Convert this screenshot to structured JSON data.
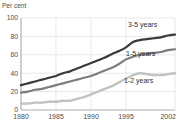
{
  "header": {
    "clipped_title": "",
    "unit_label": "Per cent"
  },
  "chart_data": {
    "type": "line",
    "title": "",
    "subtitle": "",
    "xlabel": "",
    "ylabel": "Per cent",
    "unit_label": "Per cent",
    "xlim": [
      1980,
      2002
    ],
    "ylim": [
      0,
      100
    ],
    "grid": true,
    "legend_position": "inline-right",
    "y_ticks": [
      0,
      20,
      40,
      60,
      80,
      100
    ],
    "y_tick_labels": [
      "0",
      "20",
      "40",
      "60",
      "80",
      "100"
    ],
    "x_ticks": [
      1980,
      1985,
      1990,
      1995,
      2002
    ],
    "x_tick_labels": [
      "1980",
      "1985",
      "1990",
      "1995",
      "2002"
    ],
    "x": [
      1980,
      1981,
      1982,
      1983,
      1984,
      1985,
      1986,
      1987,
      1988,
      1989,
      1990,
      1991,
      1992,
      1993,
      1994,
      1995,
      1996,
      1997,
      1998,
      1999,
      2000,
      2001,
      2002
    ],
    "series": [
      {
        "name": "3-5 years",
        "label": "3-5 years",
        "color": "#3a3a3a",
        "values": [
          27,
          29,
          31,
          33,
          35,
          37,
          40,
          42,
          45,
          48,
          51,
          54,
          57,
          61,
          64,
          68,
          74,
          76,
          77,
          78,
          79,
          81,
          82
        ]
      },
      {
        "name": "1-5 years",
        "label": "1-5 years",
        "color": "#7d7d7d",
        "values": [
          19,
          20,
          22,
          23,
          25,
          27,
          29,
          31,
          33,
          35,
          37,
          40,
          43,
          46,
          50,
          55,
          58,
          60,
          61,
          62,
          63,
          65,
          66
        ]
      },
      {
        "name": "1-2 years",
        "label": "1-2 years",
        "color": "#c2c2c2",
        "values": [
          7,
          7,
          8,
          8,
          9,
          9,
          10,
          10,
          12,
          14,
          17,
          20,
          23,
          26,
          30,
          34,
          38,
          40,
          39,
          38,
          38,
          39,
          40
        ]
      }
    ]
  },
  "plot_geometry": {
    "left": 21,
    "right": 175,
    "top": 18,
    "bottom": 110
  },
  "series_label_positions": [
    {
      "name": "3-5 years",
      "x": 128,
      "y": 27
    },
    {
      "name": "1-5 years",
      "x": 126,
      "y": 56
    },
    {
      "name": "1-2 years",
      "x": 124,
      "y": 83
    }
  ]
}
